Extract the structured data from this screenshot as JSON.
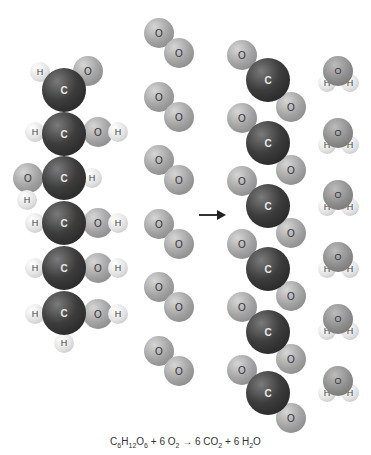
{
  "labels": {
    "carbon": "C",
    "oxygen": "O",
    "hydrogen": "H"
  },
  "equation": {
    "glucose": {
      "C": "C",
      "c_n": "6",
      "H": "H",
      "h_n": "12",
      "O": "O",
      "o_n": "6"
    },
    "plus1": " + ",
    "o2_coef": "6 ",
    "o2": {
      "O": "O",
      "n": "2"
    },
    "arrow": " → ",
    "co2_coef": "6 ",
    "co2": {
      "CO": "CO",
      "n": "2"
    },
    "plus2": " + ",
    "h2o_coef": "6 ",
    "h2o": {
      "H": "H",
      "n": "2",
      "O": "O"
    }
  },
  "reactants": {
    "glucose_count": 1,
    "oxygen_molecule_count": 6
  },
  "products": {
    "carbon_dioxide_count": 6,
    "water_count": 6
  },
  "colors": {
    "carbon": "#2e2e2e",
    "oxygen": "#a4a4a4",
    "hydrogen": "#e2e2e2",
    "arrow": "#222222",
    "background": "#ffffff"
  }
}
